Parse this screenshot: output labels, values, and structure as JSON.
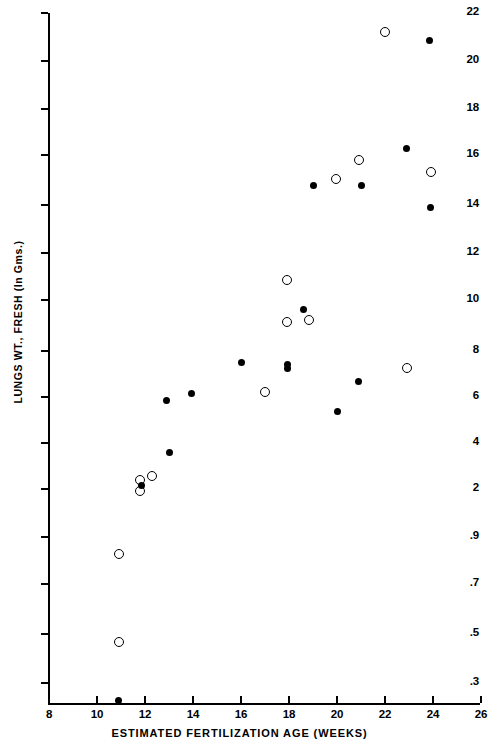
{
  "chart_data": {
    "type": "scatter",
    "title": "",
    "xlabel": "ESTIMATED FERTILIZATION AGE (WEEKS)",
    "ylabel": "LUNGS WT., FRESH (In Gms.)",
    "xlim": [
      8,
      26
    ],
    "ylim": [
      0.22,
      22
    ],
    "yscale": "log",
    "grid": false,
    "legend": "none",
    "xticks": [
      8,
      10,
      12,
      14,
      16,
      18,
      20,
      22,
      24,
      26
    ],
    "xtick_labels": [
      "8",
      "10",
      "12",
      "14",
      "16",
      "18",
      "20",
      "22",
      "24",
      "26"
    ],
    "yticks": [
      0.3,
      0.5,
      0.7,
      0.9,
      2,
      4,
      6,
      8,
      10,
      12,
      14,
      16,
      18,
      20,
      22
    ],
    "ytick_labels": [
      ".3",
      ".5",
      ".7",
      ".9",
      "2",
      "4",
      "6",
      "8",
      "10",
      "12",
      "14",
      "16",
      "18",
      "20",
      "22"
    ],
    "series": [
      {
        "name": "open-circle",
        "marker": "open-circle",
        "points": [
          {
            "x": 10.9,
            "y": 0.82
          },
          {
            "x": 10.9,
            "y": 0.46
          },
          {
            "x": 11.8,
            "y": 2.3
          },
          {
            "x": 11.8,
            "y": 1.92
          },
          {
            "x": 12.3,
            "y": 2.45
          },
          {
            "x": 17.0,
            "y": 6.2
          },
          {
            "x": 17.9,
            "y": 10.8
          },
          {
            "x": 17.9,
            "y": 9.1
          },
          {
            "x": 18.85,
            "y": 9.15
          },
          {
            "x": 19.95,
            "y": 15.0
          },
          {
            "x": 20.9,
            "y": 15.8
          },
          {
            "x": 22.0,
            "y": 21.2
          },
          {
            "x": 22.9,
            "y": 7.2
          },
          {
            "x": 23.9,
            "y": 15.3
          }
        ]
      },
      {
        "name": "filled-circle",
        "marker": "filled-circle",
        "points": [
          {
            "x": 10.9,
            "y": 0.25
          },
          {
            "x": 11.85,
            "y": 2.1
          },
          {
            "x": 12.9,
            "y": 5.8
          },
          {
            "x": 13.0,
            "y": 3.45
          },
          {
            "x": 13.95,
            "y": 6.15
          },
          {
            "x": 16.0,
            "y": 7.45
          },
          {
            "x": 17.95,
            "y": 7.35
          },
          {
            "x": 17.95,
            "y": 7.15
          },
          {
            "x": 18.6,
            "y": 9.6
          },
          {
            "x": 19.0,
            "y": 14.75
          },
          {
            "x": 20.0,
            "y": 5.3
          },
          {
            "x": 20.9,
            "y": 6.6
          },
          {
            "x": 21.0,
            "y": 14.75
          },
          {
            "x": 22.9,
            "y": 16.25
          },
          {
            "x": 23.85,
            "y": 20.85
          },
          {
            "x": 23.9,
            "y": 13.9
          }
        ]
      }
    ]
  },
  "axes": {
    "y_title": "LUNGS WT., FRESH (In Gms.)",
    "x_title": "ESTIMATED FERTILIZATION AGE (WEEKS)"
  },
  "colors": {
    "ink": "#000000",
    "background": "#ffffff"
  }
}
